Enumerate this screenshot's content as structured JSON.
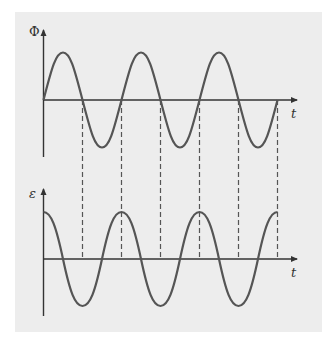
{
  "diagram": {
    "top_plot": {
      "y_label": "Φ",
      "x_label": "t",
      "curve": "sine",
      "cycles": 3
    },
    "bottom_plot": {
      "y_label": "ε",
      "x_label": "t",
      "curve": "cosine",
      "cycles": 3
    },
    "dashed_guides": 6,
    "colors": {
      "background": "#ffffff",
      "panel": "#ededed",
      "curve": "#555555",
      "axis": "#333333",
      "dashes": "#555555"
    }
  }
}
